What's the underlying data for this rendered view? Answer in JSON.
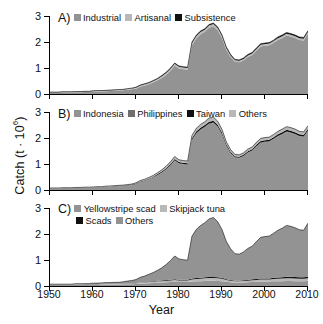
{
  "axes": {
    "ylabel_text": "Catch (t ∙ 10",
    "ylabel_exp": "6",
    "ylabel_close": ")",
    "xlabel": "Year",
    "xticks": [
      "1950",
      "1960",
      "1970",
      "1980",
      "1990",
      "2000",
      "2010"
    ],
    "yticks": [
      "0",
      "1",
      "2",
      "3"
    ]
  },
  "colors": {
    "light_gray": "#b8b8b8",
    "mid_gray": "#939393",
    "dark_gray": "#6e6e6e",
    "black": "#111111",
    "axis": "#000000"
  },
  "panels": [
    {
      "id": "A",
      "letter": "A)",
      "legend": [
        {
          "label": "Industrial",
          "color": "#939393"
        },
        {
          "label": "Artisanal",
          "color": "#b8b8b8"
        },
        {
          "label": "Subsistence",
          "color": "#111111"
        }
      ]
    },
    {
      "id": "B",
      "letter": "B)",
      "legend": [
        {
          "label": "Indonesia",
          "color": "#939393"
        },
        {
          "label": "Philippines",
          "color": "#6e6e6e"
        },
        {
          "label": "Taiwan",
          "color": "#111111"
        },
        {
          "label": "Others",
          "color": "#b8b8b8"
        }
      ]
    },
    {
      "id": "C",
      "letter": "C)",
      "legend_rows": [
        [
          {
            "label": "Yellowstripe scad",
            "color": "#939393"
          },
          {
            "label": "Skipjack tuna",
            "color": "#b8b8b8"
          }
        ],
        [
          {
            "label": "Scads",
            "color": "#111111"
          },
          {
            "label": "Others",
            "color": "#939393"
          }
        ]
      ]
    }
  ],
  "chart_data": {
    "type": "area",
    "title": "",
    "xlabel": "Year",
    "ylabel": "Catch (t × 10^6)",
    "xlim": [
      1950,
      2010
    ],
    "ylim": [
      0,
      3.2
    ],
    "grid": false,
    "legend_position": "inside-top-left",
    "stacked": true,
    "x": [
      1950,
      1951,
      1952,
      1953,
      1954,
      1955,
      1956,
      1957,
      1958,
      1959,
      1960,
      1961,
      1962,
      1963,
      1964,
      1965,
      1966,
      1967,
      1968,
      1969,
      1970,
      1971,
      1972,
      1973,
      1974,
      1975,
      1976,
      1977,
      1978,
      1979,
      1980,
      1981,
      1982,
      1983,
      1984,
      1985,
      1986,
      1987,
      1988,
      1989,
      1990,
      1991,
      1992,
      1993,
      1994,
      1995,
      1996,
      1997,
      1998,
      1999,
      2000,
      2001,
      2002,
      2003,
      2004,
      2005,
      2006,
      2007,
      2008,
      2009,
      2010
    ],
    "panels": [
      {
        "id": "A",
        "label": "By sector",
        "series": [
          {
            "name": "Industrial",
            "color": "#939393",
            "values": [
              0.05,
              0.05,
              0.05,
              0.06,
              0.06,
              0.06,
              0.07,
              0.07,
              0.08,
              0.08,
              0.09,
              0.1,
              0.1,
              0.11,
              0.12,
              0.13,
              0.14,
              0.15,
              0.17,
              0.19,
              0.22,
              0.3,
              0.35,
              0.4,
              0.47,
              0.56,
              0.66,
              0.78,
              0.95,
              1.16,
              1.05,
              1.02,
              1.0,
              2.0,
              2.28,
              2.45,
              2.55,
              2.72,
              2.78,
              2.62,
              2.3,
              1.82,
              1.52,
              1.32,
              1.3,
              1.38,
              1.52,
              1.6,
              1.78,
              1.95,
              1.98,
              2.0,
              2.1,
              2.22,
              2.3,
              2.4,
              2.36,
              2.3,
              2.22,
              2.2,
              2.48
            ]
          },
          {
            "name": "Artisanal",
            "color": "#b8b8b8",
            "values": [
              0.02,
              0.02,
              0.02,
              0.02,
              0.02,
              0.02,
              0.02,
              0.02,
              0.02,
              0.02,
              0.03,
              0.03,
              0.03,
              0.03,
              0.03,
              0.03,
              0.03,
              0.03,
              0.04,
              0.04,
              0.04,
              0.05,
              0.05,
              0.05,
              0.06,
              0.06,
              0.07,
              0.08,
              0.08,
              0.08,
              0.07,
              0.07,
              0.07,
              0.08,
              0.09,
              0.09,
              0.09,
              0.09,
              0.09,
              0.09,
              0.08,
              0.07,
              0.06,
              0.06,
              0.06,
              0.06,
              0.06,
              0.06,
              0.07,
              0.07,
              0.07,
              0.07,
              0.07,
              0.07,
              0.07,
              0.07,
              0.07,
              0.07,
              0.07,
              0.07,
              0.07
            ]
          },
          {
            "name": "Subsistence",
            "color": "#111111",
            "values": [
              0.01,
              0.01,
              0.01,
              0.01,
              0.01,
              0.01,
              0.01,
              0.01,
              0.01,
              0.01,
              0.01,
              0.01,
              0.01,
              0.01,
              0.01,
              0.01,
              0.01,
              0.01,
              0.01,
              0.01,
              0.02,
              0.02,
              0.02,
              0.02,
              0.02,
              0.02,
              0.03,
              0.03,
              0.03,
              0.03,
              0.03,
              0.03,
              0.03,
              0.04,
              0.04,
              0.04,
              0.04,
              0.04,
              0.04,
              0.04,
              0.04,
              0.04,
              0.04,
              0.04,
              0.04,
              0.04,
              0.04,
              0.04,
              0.04,
              0.04,
              0.04,
              0.04,
              0.04,
              0.05,
              0.05,
              0.05,
              0.05,
              0.05,
              0.05,
              0.05,
              0.05
            ]
          }
        ],
        "peak": {
          "year": 1988,
          "value": 2.88
        }
      },
      {
        "id": "B",
        "label": "By country",
        "series": [
          {
            "name": "Indonesia",
            "color": "#939393",
            "values": [
              0.06,
              0.06,
              0.06,
              0.07,
              0.07,
              0.07,
              0.08,
              0.08,
              0.09,
              0.09,
              0.1,
              0.11,
              0.11,
              0.12,
              0.13,
              0.14,
              0.15,
              0.16,
              0.18,
              0.2,
              0.24,
              0.32,
              0.37,
              0.43,
              0.5,
              0.6,
              0.7,
              0.83,
              1.0,
              1.2,
              1.08,
              1.05,
              1.03,
              2.02,
              2.3,
              2.45,
              2.56,
              2.7,
              2.74,
              2.58,
              2.26,
              1.8,
              1.5,
              1.32,
              1.3,
              1.38,
              1.52,
              1.6,
              1.78,
              1.93,
              1.96,
              1.98,
              2.08,
              2.2,
              2.28,
              2.38,
              2.34,
              2.28,
              2.2,
              2.18,
              2.42
            ]
          },
          {
            "name": "Philippines",
            "color": "#6e6e6e",
            "values": [
              0.01,
              0.01,
              0.01,
              0.01,
              0.01,
              0.01,
              0.01,
              0.01,
              0.01,
              0.01,
              0.01,
              0.01,
              0.01,
              0.01,
              0.01,
              0.01,
              0.01,
              0.01,
              0.01,
              0.01,
              0.01,
              0.01,
              0.01,
              0.01,
              0.02,
              0.02,
              0.02,
              0.02,
              0.02,
              0.02,
              0.02,
              0.02,
              0.02,
              0.03,
              0.03,
              0.03,
              0.03,
              0.03,
              0.03,
              0.03,
              0.03,
              0.02,
              0.02,
              0.02,
              0.02,
              0.02,
              0.02,
              0.02,
              0.02,
              0.02,
              0.02,
              0.02,
              0.02,
              0.02,
              0.02,
              0.02,
              0.02,
              0.02,
              0.02,
              0.02,
              0.02
            ]
          },
          {
            "name": "Taiwan",
            "color": "#111111",
            "values": [
              0.005,
              0.005,
              0.005,
              0.005,
              0.005,
              0.005,
              0.005,
              0.005,
              0.006,
              0.006,
              0.006,
              0.007,
              0.007,
              0.008,
              0.008,
              0.009,
              0.01,
              0.011,
              0.012,
              0.014,
              0.016,
              0.02,
              0.022,
              0.025,
              0.028,
              0.032,
              0.036,
              0.042,
              0.048,
              0.055,
              0.05,
              0.048,
              0.047,
              0.06,
              0.065,
              0.07,
              0.072,
              0.075,
              0.076,
              0.072,
              0.066,
              0.055,
              0.048,
              0.042,
              0.042,
              0.045,
              0.048,
              0.05,
              0.055,
              0.06,
              0.06,
              0.06,
              0.062,
              0.065,
              0.068,
              0.07,
              0.07,
              0.068,
              0.066,
              0.065,
              0.07
            ]
          },
          {
            "name": "Others",
            "color": "#b8b8b8",
            "values": [
              0.01,
              0.01,
              0.01,
              0.01,
              0.01,
              0.01,
              0.01,
              0.01,
              0.01,
              0.01,
              0.01,
              0.01,
              0.01,
              0.02,
              0.02,
              0.02,
              0.02,
              0.02,
              0.02,
              0.02,
              0.03,
              0.04,
              0.04,
              0.05,
              0.05,
              0.06,
              0.07,
              0.08,
              0.09,
              0.1,
              0.09,
              0.09,
              0.09,
              0.12,
              0.13,
              0.14,
              0.14,
              0.15,
              0.15,
              0.14,
              0.13,
              0.1,
              0.09,
              0.08,
              0.08,
              0.08,
              0.09,
              0.09,
              0.1,
              0.11,
              0.11,
              0.11,
              0.12,
              0.12,
              0.13,
              0.13,
              0.13,
              0.13,
              0.12,
              0.12,
              0.13
            ]
          }
        ],
        "peak": {
          "year": 1988,
          "value": 2.85
        }
      },
      {
        "id": "C",
        "label": "By taxon",
        "series": [
          {
            "name": "Yellowstripe scad",
            "color": "#939393",
            "values": [
              0.04,
              0.04,
              0.04,
              0.04,
              0.04,
              0.04,
              0.05,
              0.05,
              0.05,
              0.05,
              0.05,
              0.05,
              0.06,
              0.06,
              0.06,
              0.06,
              0.06,
              0.07,
              0.07,
              0.07,
              0.08,
              0.09,
              0.1,
              0.11,
              0.12,
              0.13,
              0.14,
              0.15,
              0.16,
              0.17,
              0.16,
              0.16,
              0.16,
              0.18,
              0.19,
              0.2,
              0.21,
              0.22,
              0.22,
              0.21,
              0.2,
              0.17,
              0.15,
              0.13,
              0.13,
              0.14,
              0.15,
              0.16,
              0.17,
              0.18,
              0.18,
              0.18,
              0.19,
              0.2,
              0.2,
              0.21,
              0.21,
              0.2,
              0.2,
              0.2,
              0.21
            ]
          },
          {
            "name": "Skipjack tuna",
            "color": "#b8b8b8",
            "values": [
              0.01,
              0.01,
              0.01,
              0.01,
              0.01,
              0.01,
              0.01,
              0.01,
              0.01,
              0.01,
              0.02,
              0.02,
              0.02,
              0.02,
              0.02,
              0.02,
              0.02,
              0.02,
              0.03,
              0.03,
              0.03,
              0.04,
              0.04,
              0.05,
              0.05,
              0.06,
              0.06,
              0.07,
              0.07,
              0.08,
              0.07,
              0.07,
              0.07,
              0.09,
              0.1,
              0.1,
              0.11,
              0.11,
              0.11,
              0.11,
              0.1,
              0.08,
              0.07,
              0.06,
              0.06,
              0.07,
              0.07,
              0.08,
              0.08,
              0.09,
              0.09,
              0.09,
              0.1,
              0.1,
              0.11,
              0.11,
              0.11,
              0.11,
              0.1,
              0.1,
              0.11
            ]
          },
          {
            "name": "Scads",
            "color": "#111111",
            "values": [
              0.005,
              0.005,
              0.005,
              0.005,
              0.006,
              0.006,
              0.006,
              0.006,
              0.007,
              0.007,
              0.007,
              0.008,
              0.008,
              0.009,
              0.009,
              0.01,
              0.01,
              0.011,
              0.012,
              0.013,
              0.014,
              0.016,
              0.018,
              0.02,
              0.022,
              0.024,
              0.026,
              0.028,
              0.03,
              0.032,
              0.03,
              0.03,
              0.03,
              0.034,
              0.036,
              0.038,
              0.04,
              0.042,
              0.042,
              0.04,
              0.038,
              0.032,
              0.028,
              0.026,
              0.026,
              0.028,
              0.03,
              0.032,
              0.034,
              0.036,
              0.038,
              0.04,
              0.044,
              0.048,
              0.052,
              0.056,
              0.058,
              0.058,
              0.058,
              0.058,
              0.06
            ]
          },
          {
            "name": "Others",
            "color": "#939393",
            "values": [
              0.02,
              0.02,
              0.02,
              0.02,
              0.02,
              0.02,
              0.03,
              0.03,
              0.03,
              0.03,
              0.04,
              0.04,
              0.04,
              0.05,
              0.05,
              0.06,
              0.06,
              0.07,
              0.09,
              0.11,
              0.14,
              0.21,
              0.25,
              0.3,
              0.36,
              0.43,
              0.52,
              0.63,
              0.78,
              0.95,
              0.85,
              0.82,
              0.8,
              1.73,
              1.99,
              2.14,
              2.24,
              2.38,
              2.44,
              2.28,
              1.98,
              1.55,
              1.28,
              1.11,
              1.09,
              1.16,
              1.29,
              1.36,
              1.54,
              1.69,
              1.72,
              1.74,
              1.83,
              1.94,
              2.01,
              2.11,
              2.07,
              2.02,
              1.95,
              1.93,
              2.2
            ]
          }
        ],
        "peak": {
          "year": 1988,
          "value": 2.85
        }
      }
    ]
  }
}
